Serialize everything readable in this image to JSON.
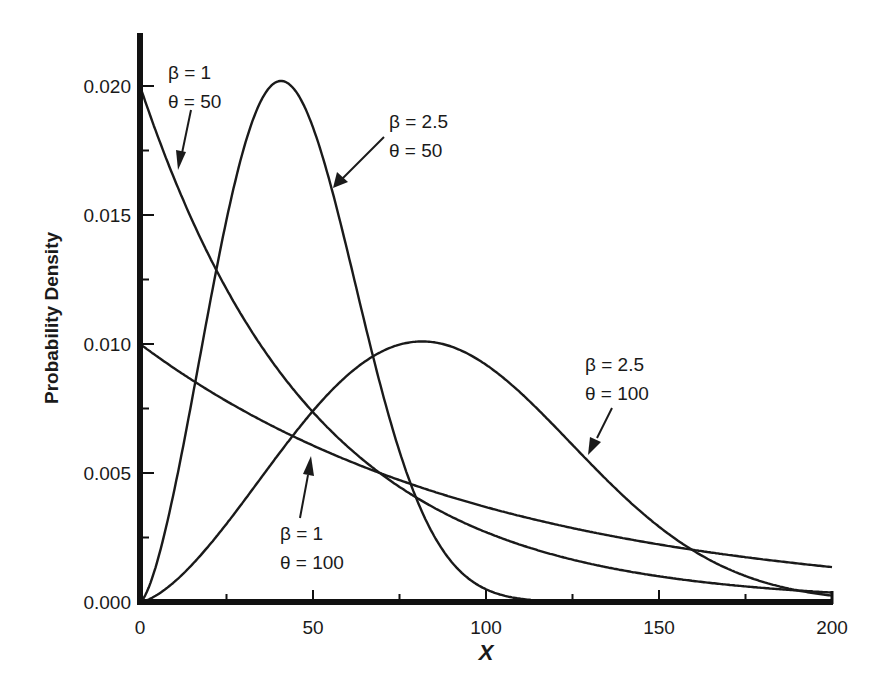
{
  "chart_data": {
    "type": "line",
    "title": "",
    "xlabel": "X",
    "ylabel": "Probability Density",
    "xlim": [
      0,
      200
    ],
    "ylim": [
      0,
      0.022
    ],
    "grid": false,
    "legend": "none (inline arrow annotations)",
    "x_ticks": [
      "0",
      "50",
      "100",
      "150",
      "200"
    ],
    "x_minor_ticks": [
      25,
      75,
      125,
      175
    ],
    "y_ticks": [
      "0.000",
      "0.005",
      "0.010",
      "0.015",
      "0.020"
    ],
    "y_minor_ticks": [
      0.0025,
      0.0075,
      0.0125,
      0.0175
    ],
    "distribution": "Weibull pdf f(x) = (beta/theta)(x/theta)^(beta-1) exp(-(x/theta)^beta)",
    "x": [
      0,
      10,
      20,
      30,
      40,
      50,
      60,
      70,
      80,
      90,
      100,
      110,
      120,
      130,
      140,
      150,
      160,
      170,
      180,
      190,
      200
    ],
    "series": [
      {
        "name": "β = 1, θ = 50",
        "beta": 1,
        "theta": 50,
        "values": [
          0.02,
          0.0164,
          0.0134,
          0.011,
          0.009,
          0.0074,
          0.006,
          0.0049,
          0.004,
          0.0033,
          0.0027,
          0.0022,
          0.0018,
          0.0015,
          0.0012,
          0.001,
          0.0008,
          0.0007,
          0.0005,
          0.0004,
          0.0004
        ]
      },
      {
        "name": "β = 2.5, θ = 50",
        "beta": 2.5,
        "theta": 50,
        "values": [
          0.0,
          0.0089,
          0.0185,
          0.0197,
          0.016,
          0.0074,
          0.0017,
          0.0002,
          0.0,
          0.0,
          0.0,
          0.0,
          0.0,
          0.0,
          0.0,
          0.0,
          0.0,
          0.0,
          0.0,
          0.0,
          0.0
        ]
      },
      {
        "name": "β = 1, θ = 100",
        "beta": 1,
        "theta": 100,
        "values": [
          0.01,
          0.009,
          0.0082,
          0.0074,
          0.0067,
          0.0061,
          0.0055,
          0.005,
          0.0045,
          0.0041,
          0.0037,
          0.0033,
          0.003,
          0.0027,
          0.0025,
          0.0022,
          0.002,
          0.0018,
          0.0017,
          0.0015,
          0.0014
        ]
      },
      {
        "name": "β = 2.5, θ = 100",
        "beta": 2.5,
        "theta": 100,
        "values": [
          0.0,
          0.0008,
          0.0022,
          0.004,
          0.006,
          0.0078,
          0.0092,
          0.01,
          0.0099,
          0.009,
          0.0074,
          0.0055,
          0.0037,
          0.0022,
          0.0012,
          0.0006,
          0.0002,
          0.0001,
          0.0,
          0.0,
          0.0
        ]
      }
    ],
    "annotations": [
      {
        "line1": "β = 1",
        "line2": "θ = 50"
      },
      {
        "line1": "β = 2.5",
        "line2": "θ = 50"
      },
      {
        "line1": "β = 2.5",
        "line2": "θ = 100"
      },
      {
        "line1": "β = 1",
        "line2": "θ = 100"
      }
    ]
  },
  "labels": {
    "x_axis": "X",
    "y_axis": "Probability Density"
  }
}
